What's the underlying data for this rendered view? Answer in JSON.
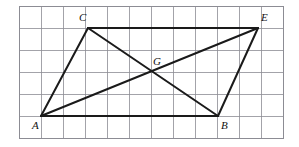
{
  "figure": {
    "background_color": "#ffffff",
    "line_color": "#1a1a1a",
    "grid_color": "#8c8c94",
    "grid": {
      "x_start": 19,
      "y_start": 6,
      "cell_size": 22,
      "columns": 12,
      "rows": 6,
      "visible": true
    },
    "points": [
      {
        "id": "A",
        "label": "A",
        "x": 41,
        "y": 116,
        "label_dx": -9,
        "label_dy": 4
      },
      {
        "id": "B",
        "label": "B",
        "x": 218,
        "y": 116,
        "label_dx": 3,
        "label_dy": 4
      },
      {
        "id": "C",
        "label": "C",
        "x": 88,
        "y": 28,
        "label_dx": -9,
        "label_dy": -16
      },
      {
        "id": "E",
        "label": "E",
        "x": 258,
        "y": 28,
        "label_dx": 3,
        "label_dy": -16
      },
      {
        "id": "G",
        "label": "G",
        "x": 155,
        "y": 72,
        "label_dx": -2,
        "label_dy": -16
      }
    ],
    "edges": [
      {
        "id": "AC",
        "from": "A",
        "to": "C",
        "kind": "side"
      },
      {
        "id": "CE",
        "from": "C",
        "to": "E",
        "kind": "side"
      },
      {
        "id": "EB",
        "from": "E",
        "to": "B",
        "kind": "side"
      },
      {
        "id": "BA",
        "from": "B",
        "to": "A",
        "kind": "side"
      },
      {
        "id": "AE",
        "from": "A",
        "to": "E",
        "kind": "diagonal"
      },
      {
        "id": "CB",
        "from": "C",
        "to": "B",
        "kind": "diagonal"
      }
    ],
    "intersection": {
      "id": "G",
      "of": [
        "AE",
        "CB"
      ]
    }
  }
}
